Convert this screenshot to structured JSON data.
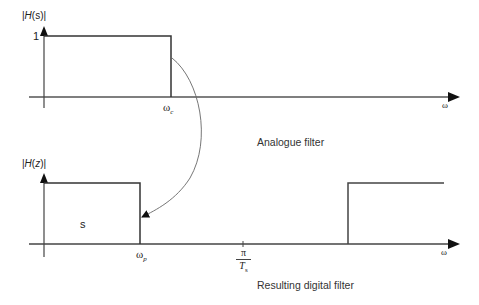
{
  "analogue": {
    "y_label_prefix": "|",
    "y_label_H": "H",
    "y_label_arg": "(s)",
    "y_label_suffix": "|",
    "level_label": "1",
    "cutoff_label": "ω",
    "cutoff_sub": "c",
    "x_label": "ω",
    "caption": "Analogue filter"
  },
  "digital": {
    "y_label_prefix": "|",
    "y_label_H": "H",
    "y_label_open": "(",
    "y_label_var": "z",
    "y_label_close": ")|",
    "passband_mark": "s",
    "cutoff_label": "ω",
    "cutoff_sub": "p",
    "nyquist_num": "π",
    "nyquist_den": "T",
    "nyquist_den_sub": "s",
    "x_label": "ω",
    "caption": "Resulting digital filter"
  },
  "colors": {
    "line": "#333333",
    "axis": "#555555",
    "curve": "#666666"
  }
}
